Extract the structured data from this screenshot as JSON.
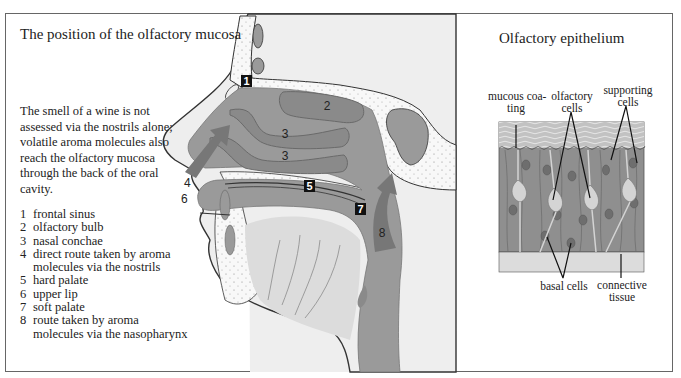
{
  "left_panel": {
    "title": "The position of the olfactory mucosa",
    "caption": "The smell of a wine is not assessed via the nostrils alone; volatile aroma molecules also reach the olfactory mucosa through the back of the oral cavity.",
    "legend": [
      {
        "num": "1",
        "text": "frontal sinus"
      },
      {
        "num": "2",
        "text": "olfactory bulb"
      },
      {
        "num": "3",
        "text": "nasal conchae"
      },
      {
        "num": "4",
        "text": "direct route taken by aroma"
      },
      {
        "num": "",
        "text": "molecules via the nostrils"
      },
      {
        "num": "5",
        "text": "hard palate"
      },
      {
        "num": "6",
        "text": "upper lip"
      },
      {
        "num": "7",
        "text": "soft palate"
      },
      {
        "num": "8",
        "text": "route taken by aroma"
      },
      {
        "num": "",
        "text": "molecules via the nasopharynx"
      }
    ],
    "markers": {
      "m1": "1",
      "m2": "2",
      "m3a": "3",
      "m3b": "3",
      "m4": "4",
      "m5": "5",
      "m6": "6",
      "m7": "7",
      "m8": "8"
    }
  },
  "right_panel": {
    "title": "Olfactory epithelium",
    "labels": {
      "mucous": "mucous coa-\nting",
      "olfactory": "olfactory\ncells",
      "supporting": "supporting\ncells",
      "basal": "basal cells",
      "connective": "connective\ntissue"
    }
  },
  "colors": {
    "panel_bg": "#eeeeee",
    "mucosa": "#9a9a9a",
    "conchae": "#8a8a8a",
    "arrow": "#777777",
    "bone_dots": "#f7f7f7",
    "tissue_light": "#dcdcdc",
    "epithelium": "#8f8f8f",
    "mucus": "#c4c4c4"
  }
}
